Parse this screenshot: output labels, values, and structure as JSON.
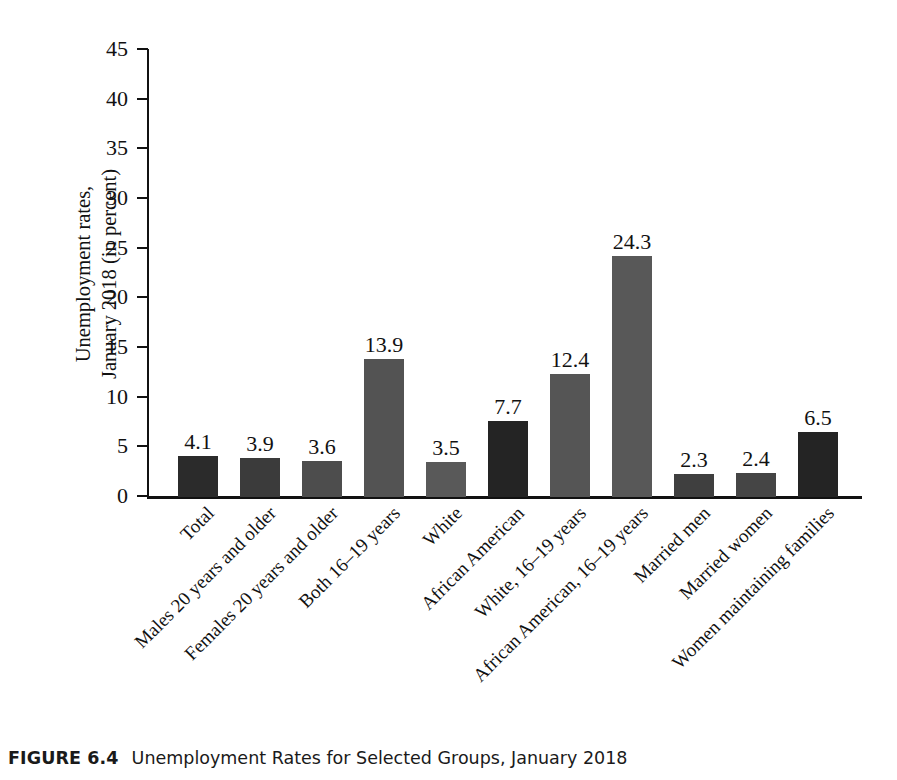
{
  "caption": {
    "figure_number": "FIGURE 6.4",
    "title": "Unemployment Rates for Selected Groups, January 2018"
  },
  "chart_data": {
    "type": "bar",
    "title": "Unemployment Rates for Selected Groups, January 2018",
    "xlabel": "",
    "ylabel": "Unemployment rates, January 2018 (in percent)",
    "ylabel_lines": [
      "Unemployment rates,",
      "January 2018 (in percent)"
    ],
    "ylim": [
      0,
      45
    ],
    "yticks": [
      0,
      5,
      10,
      15,
      20,
      25,
      30,
      35,
      40,
      45
    ],
    "ytick_labels": [
      "0",
      "5",
      "10",
      "15",
      "20",
      "25",
      "30",
      "35",
      "40",
      "45"
    ],
    "grid": false,
    "legend": "none",
    "categories": [
      "Total",
      "Males 20 years and older",
      "Females 20 years and older",
      "Both 16–19 years",
      "White",
      "African American",
      "White, 16–19 years",
      "African American, 16–19 years",
      "Married men",
      "Married women",
      "Women maintaining families"
    ],
    "values": [
      4.1,
      3.9,
      3.6,
      13.9,
      3.5,
      7.7,
      12.4,
      24.3,
      2.3,
      2.4,
      6.5
    ],
    "value_labels": [
      "4.1",
      "3.9",
      "3.6",
      "13.9",
      "3.5",
      "7.7",
      "12.4",
      "24.3",
      "2.3",
      "2.4",
      "6.5"
    ],
    "bar_colors": [
      "#2b2b2b",
      "#3b3b3b",
      "#4d4d4d",
      "#535353",
      "#595959",
      "#242424",
      "#555555",
      "#585858",
      "#3f3f3f",
      "#454545",
      "#242424"
    ],
    "axis_color": "#111111",
    "background_color": "#ffffff"
  }
}
